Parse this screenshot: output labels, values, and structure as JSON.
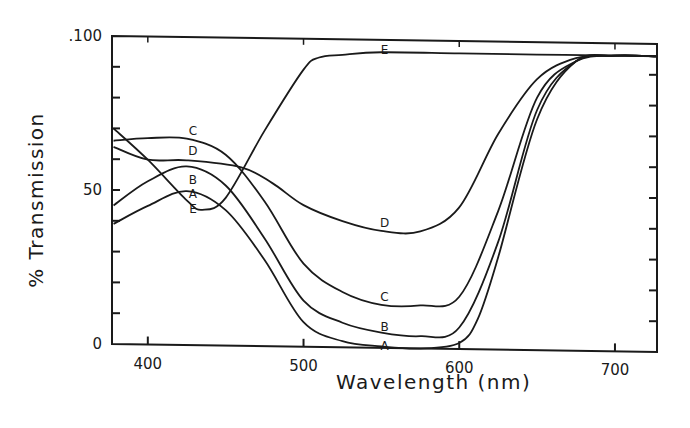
{
  "chart_data": {
    "type": "line",
    "title": "",
    "xlabel": "Wavelength (nm)",
    "ylabel": "% Transmission",
    "xlim": [
      377,
      727
    ],
    "ylim": [
      0,
      100
    ],
    "x_ticks": [
      400,
      500,
      600,
      700
    ],
    "y_tick_labels": [
      "0",
      "50",
      "100"
    ],
    "y_minor_ticks": [
      10,
      20,
      30,
      40,
      50,
      60,
      70,
      80,
      90
    ],
    "grid": false,
    "legend": "inline curve labels A-E",
    "series": [
      {
        "name": "A",
        "x": [
          378,
          400,
          425,
          450,
          475,
          500,
          525,
          550,
          575,
          600,
          612,
          625,
          650,
          675,
          700,
          727
        ],
        "y": [
          39,
          45,
          50,
          44,
          28,
          8,
          2,
          0.5,
          0,
          2,
          10,
          30,
          75,
          94,
          96,
          96
        ],
        "label_pos": [
          430,
          51
        ]
      },
      {
        "name": "B",
        "x": [
          378,
          400,
          425,
          450,
          475,
          500,
          525,
          550,
          575,
          600,
          625,
          650,
          675,
          700,
          727
        ],
        "y": [
          45,
          53,
          58,
          52,
          35,
          15,
          8,
          5,
          4,
          7,
          35,
          78,
          94,
          96,
          96
        ],
        "label_pos": [
          430,
          57
        ]
      },
      {
        "name": "C",
        "x": [
          378,
          400,
          425,
          450,
          475,
          500,
          525,
          550,
          575,
          600,
          625,
          650,
          675,
          700,
          727
        ],
        "y": [
          66,
          67,
          67,
          62,
          47,
          27,
          18,
          14,
          14,
          17,
          45,
          82,
          94,
          96,
          96
        ],
        "label_pos": [
          430,
          69
        ]
      },
      {
        "name": "D",
        "x": [
          378,
          400,
          425,
          460,
          480,
          500,
          525,
          550,
          575,
          600,
          625,
          650,
          675,
          700,
          727
        ],
        "y": [
          64,
          60,
          60,
          58,
          53,
          46,
          41,
          38,
          38,
          46,
          70,
          88,
          95,
          96,
          96
        ],
        "label_pos": [
          430,
          62
        ]
      },
      {
        "name": "E",
        "x": [
          378,
          400,
          425,
          435,
          450,
          475,
          500,
          510,
          525,
          550,
          600,
          650,
          700,
          727
        ],
        "y": [
          70,
          60,
          47,
          44,
          48,
          70,
          90,
          94,
          95,
          96,
          96,
          96,
          96,
          96
        ],
        "label_pos": [
          430,
          44
        ]
      }
    ],
    "annotations": [
      {
        "text": "E",
        "x": 552,
        "y": 97
      },
      {
        "text": "D",
        "x": 552,
        "y": 41
      },
      {
        "text": "C",
        "x": 552,
        "y": 17
      },
      {
        "text": "B",
        "x": 552,
        "y": 7
      },
      {
        "text": "A",
        "x": 552,
        "y": 1
      }
    ]
  },
  "axes": {
    "x_title": "Wavelength (nm)",
    "y_title": "% Transmission",
    "x_tick_labels": [
      "400",
      "500",
      "600",
      "700"
    ],
    "y_tick_labels": [
      "0",
      "50",
      ".100"
    ]
  }
}
